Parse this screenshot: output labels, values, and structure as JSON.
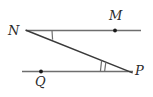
{
  "figure": {
    "type": "geometry-diagram",
    "background_color": "#ffffff",
    "stroke_color": "#6e6e6e",
    "transversal_color": "#3a3a3a",
    "tick_color": "#6e6e6e",
    "label_color": "#2b2b2b",
    "points": [
      {
        "name": "N",
        "label": "N",
        "x": 26,
        "y": 30.5,
        "dot": false,
        "label_x": 8,
        "label_y": 24
      },
      {
        "name": "M",
        "label": "M",
        "x": 115,
        "y": 30.5,
        "dot": true,
        "label_x": 109,
        "label_y": 9
      },
      {
        "name": "Q",
        "label": "Q",
        "x": 41,
        "y": 71.5,
        "dot": true,
        "label_x": 35,
        "label_y": 75
      },
      {
        "name": "P",
        "label": "P",
        "x": 131,
        "y": 71.5,
        "dot": false,
        "label_x": 135,
        "label_y": 64
      }
    ],
    "segments": [
      {
        "name": "ray-NM",
        "x1": 26,
        "y1": 30.5,
        "x2": 141,
        "y2": 30.5
      },
      {
        "name": "line-QP",
        "x1": 22,
        "y1": 71.5,
        "x2": 133,
        "y2": 71.5
      },
      {
        "name": "transversal-NP",
        "x1": 26,
        "y1": 30.5,
        "x2": 132,
        "y2": 72.5
      }
    ],
    "angle_marks": [
      {
        "name": "angle-mark-N",
        "vertex": "N",
        "ticks": 1,
        "x1": 52,
        "y1": 30.5,
        "x2": 52.5,
        "y2": 39.5
      },
      {
        "name": "angle-mark-P",
        "vertex": "P",
        "ticks": 2,
        "tick_a": {
          "x1": 101.5,
          "y1": 60.5,
          "x2": 100.5,
          "y2": 71.5
        },
        "tick_b": {
          "x1": 105.5,
          "y1": 62.5,
          "x2": 104.5,
          "y2": 71.5
        }
      }
    ]
  }
}
